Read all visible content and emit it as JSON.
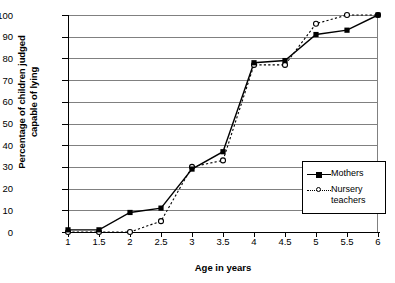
{
  "chart_data": {
    "type": "line",
    "title": "",
    "xlabel": "Age in years",
    "ylabel": "Percentage of children judged\ncapable of lying",
    "categories": [
      "1",
      "1.5",
      "2",
      "2.5",
      "3",
      "3.5",
      "4",
      "4.5",
      "5",
      "5.5",
      "6"
    ],
    "x": [
      1,
      1.5,
      2,
      2.5,
      3,
      3.5,
      4,
      4.5,
      5,
      5.5,
      6
    ],
    "xlim": [
      1,
      6
    ],
    "ylim": [
      0,
      100
    ],
    "yticks": [
      0,
      10,
      20,
      30,
      40,
      50,
      60,
      70,
      80,
      90,
      100
    ],
    "grid": "horizontal",
    "legend_position": "right-inside",
    "series": [
      {
        "name": "Mothers",
        "marker": "filled-square",
        "line_style": "solid",
        "color": "#000000",
        "values": [
          1,
          1,
          9,
          11,
          29,
          37,
          78,
          79,
          91,
          93,
          100
        ]
      },
      {
        "name": "Nursery\nteachers",
        "legend_label": "Nursery teachers",
        "marker": "open-circle",
        "line_style": "dotted",
        "color": "#000000",
        "values": [
          0,
          0,
          0,
          5,
          30,
          33,
          77,
          77,
          96,
          100,
          100
        ]
      }
    ]
  },
  "axes": {
    "y_tick_labels": [
      "100",
      "90",
      "80",
      "70",
      "60",
      "50",
      "40",
      "30",
      "20",
      "10",
      "0"
    ],
    "x_tick_labels": [
      "1",
      "1.5",
      "2",
      "2.5",
      "3",
      "3.5",
      "4",
      "4.5",
      "5",
      "5.5",
      "6"
    ],
    "x_title": "Age in years",
    "y_title": "Percentage of children judged\ncapable of lying"
  },
  "legend": {
    "items": [
      {
        "label": "Mothers"
      },
      {
        "label": "Nursery\nteachers"
      }
    ]
  },
  "colors": {
    "gridline": "#808080",
    "series": "#000000",
    "background": "#ffffff"
  }
}
